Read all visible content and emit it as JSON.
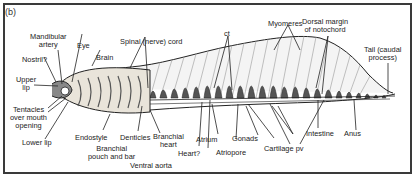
{
  "panel_label": "(b)",
  "labels": {
    "mandibular_artery": [
      "Mandibular",
      "artery"
    ],
    "eye": "Eye",
    "nostril": "Nostril?",
    "brain": "Brain",
    "spinal_cord": "Spinal (nerve) cord",
    "ct": "ct",
    "myomeres": "Myomeres",
    "dorsal_margin": [
      "Dorsal margin",
      "of notochord"
    ],
    "upper_lip": [
      "Upper",
      "lip"
    ],
    "tentacles": [
      "Tentacles",
      "over mouth",
      "opening"
    ],
    "lower_lip": "Lower lip",
    "endostyle": "Endostyle",
    "denticles": "Denticles",
    "branchial_pouch": [
      "Branchial",
      "pouch and bar"
    ],
    "ventral_aorta": "Ventral aorta",
    "branchial_heart": [
      "Branchial",
      "heart"
    ],
    "heart": "Heart?",
    "atrium": "Atrium",
    "atriopore": "Atriopore",
    "gonads": "Gonads",
    "cartilage_pv": "Cartilage pv",
    "intestine": "Intestine",
    "anus": "Anus",
    "tail": [
      "Tail (caudal",
      "process)"
    ]
  },
  "colors": {
    "frame": "#3a3a3a",
    "outline": "#222222",
    "myomere_fill": "#f2f2f2",
    "cartilage_fill": "#555555",
    "pharynx_fill": "#e6e0d6"
  }
}
